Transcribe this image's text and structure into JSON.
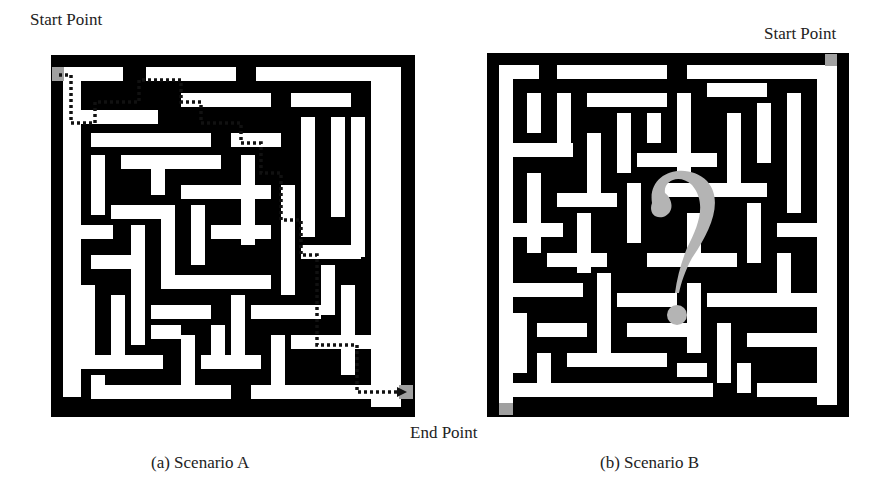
{
  "figure": {
    "scenario_a": {
      "caption": "(a) Scenario A",
      "start_label": "Start Point",
      "end_label": "End Point",
      "start_marker_color": "#a0a0a0",
      "end_marker_color": "#a0a0a0",
      "solution_path_style": "dotted",
      "solution_path_color": "#111111"
    },
    "scenario_b": {
      "caption": "(b) Scenario B",
      "start_label": "Start Point",
      "overlay_symbol": "?",
      "overlay_color": "#b4b4b4",
      "start_marker_color": "#a0a0a0",
      "end_marker_color": "#a0a0a0"
    },
    "colors": {
      "wall": "#000000",
      "corridor": "#ffffff"
    }
  }
}
